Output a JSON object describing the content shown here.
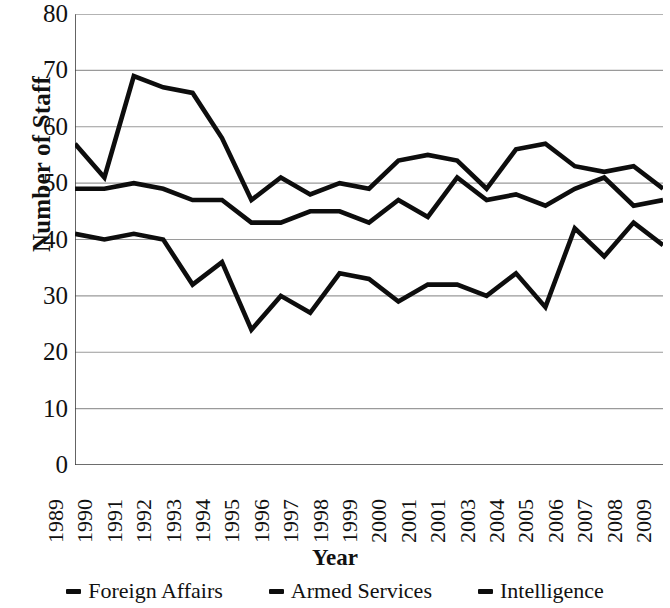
{
  "chart_data": {
    "type": "line",
    "title": "",
    "xlabel": "Year",
    "ylabel": "Number of Staff",
    "ylim": [
      0,
      80
    ],
    "ytick_step": 10,
    "yticks": [
      80,
      70,
      60,
      50,
      40,
      30,
      20,
      10,
      0
    ],
    "grid": "horizontal",
    "legend_position": "bottom",
    "line_color": "#0d0d0d",
    "grid_color": "#9a9a9a",
    "axis_color": "#3d3d3d",
    "background": "#ffffff",
    "categories": [
      "1989",
      "1990",
      "1991",
      "1992",
      "1993",
      "1994",
      "1995",
      "1996",
      "1997",
      "1998",
      "1999",
      "2000",
      "2001",
      "2001",
      "2003",
      "2004",
      "2005",
      "2006",
      "2007",
      "2008",
      "2009"
    ],
    "series": [
      {
        "name": "Foreign Affairs",
        "values": [
          57,
          51,
          69,
          67,
          66,
          58,
          47,
          51,
          48,
          50,
          49,
          54,
          55,
          54,
          49,
          56,
          57,
          53,
          52,
          53,
          49
        ]
      },
      {
        "name": "Armed Services",
        "values": [
          49,
          49,
          50,
          49,
          47,
          47,
          43,
          43,
          45,
          45,
          43,
          47,
          44,
          51,
          47,
          48,
          46,
          49,
          51,
          46,
          47
        ]
      },
      {
        "name": "Intelligence",
        "values": [
          41,
          40,
          41,
          40,
          32,
          36,
          24,
          30,
          27,
          34,
          33,
          29,
          32,
          32,
          30,
          34,
          28,
          42,
          37,
          43,
          39
        ]
      }
    ]
  },
  "legend": {
    "items": [
      {
        "label": "Foreign Affairs",
        "marker": "dash-marker"
      },
      {
        "label": "Armed Services",
        "marker": "dash-marker"
      },
      {
        "label": "Intelligence",
        "marker": "dash-marker"
      }
    ]
  }
}
